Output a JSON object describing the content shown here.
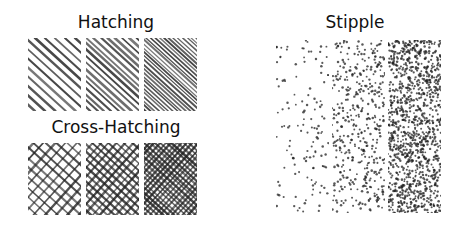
{
  "sections": {
    "hatching": {
      "title": "Hatching",
      "panels": [
        {
          "density": "light",
          "spacing": 10
        },
        {
          "density": "medium",
          "spacing": 7
        },
        {
          "density": "dense",
          "spacing": 4.5
        }
      ]
    },
    "cross_hatching": {
      "title": "Cross-Hatching",
      "panels": [
        {
          "density": "light",
          "spacing": 11
        },
        {
          "density": "medium",
          "spacing": 8
        },
        {
          "density": "dense",
          "spacing": 5.5
        }
      ]
    },
    "stipple": {
      "title": "Stipple",
      "panels": [
        {
          "density": "light",
          "dots": 130
        },
        {
          "density": "medium",
          "dots": 420
        },
        {
          "density": "dense",
          "dots": 1100
        }
      ]
    }
  },
  "colors": {
    "ink": "#222222",
    "background": "#ffffff"
  }
}
